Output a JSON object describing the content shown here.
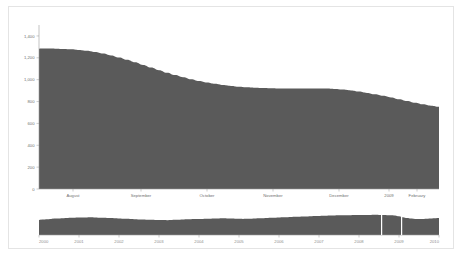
{
  "card": {
    "border_color": "#e4e4e4",
    "background": "#ffffff"
  },
  "chart_data": {
    "type": "area",
    "title": "",
    "subtitle": "",
    "xlabel": "",
    "ylabel": "",
    "grid": false,
    "legend": false,
    "series_color": "#5a5a5a",
    "ylim": [
      0,
      1500
    ],
    "y_ticks": [
      "0",
      "200",
      "400",
      "600",
      "800",
      "1,000",
      "1,200",
      "1,400"
    ],
    "y_tick_values": [
      0,
      200,
      400,
      600,
      800,
      1000,
      1200,
      1400
    ],
    "x_tick_labels": [
      "August",
      "September",
      "October",
      "November",
      "December",
      "2009",
      "February"
    ],
    "x_tick_positions": [
      0.085,
      0.255,
      0.42,
      0.585,
      0.75,
      0.875,
      0.945
    ],
    "x": [
      0.0,
      0.02,
      0.04,
      0.06,
      0.08,
      0.1,
      0.12,
      0.14,
      0.16,
      0.18,
      0.2,
      0.22,
      0.24,
      0.26,
      0.28,
      0.3,
      0.32,
      0.34,
      0.36,
      0.38,
      0.4,
      0.42,
      0.44,
      0.46,
      0.48,
      0.5,
      0.52,
      0.54,
      0.56,
      0.58,
      0.6,
      0.62,
      0.64,
      0.66,
      0.68,
      0.7,
      0.72,
      0.74,
      0.76,
      0.78,
      0.8,
      0.82,
      0.84,
      0.86,
      0.88,
      0.9,
      0.92,
      0.94,
      0.96,
      0.98,
      1.0
    ],
    "values": [
      1283,
      1284,
      1283,
      1281,
      1278,
      1272,
      1264,
      1253,
      1239,
      1222,
      1203,
      1182,
      1159,
      1135,
      1111,
      1087,
      1064,
      1042,
      1022,
      1004,
      988,
      974,
      962,
      951,
      943,
      936,
      931,
      927,
      924,
      922,
      920,
      919,
      919,
      919,
      920,
      920,
      919,
      915,
      909,
      901,
      891,
      879,
      866,
      852,
      838,
      822,
      806,
      790,
      775,
      762,
      752
    ],
    "series_name": ""
  },
  "navigator": {
    "type": "area",
    "color": "#5a5a5a",
    "year_labels": [
      "2000",
      "2001",
      "2002",
      "2003",
      "2004",
      "2005",
      "2006",
      "2007",
      "2008",
      "2009",
      "2010"
    ],
    "year_positions": [
      0.0,
      0.1,
      0.2,
      0.3,
      0.4,
      0.5,
      0.6,
      0.7,
      0.8,
      0.9,
      1.0
    ],
    "selection": {
      "start": 0.855,
      "end": 0.905,
      "handle_color": "#ffffff"
    },
    "values": [
      560,
      575,
      590,
      600,
      612,
      618,
      626,
      634,
      640,
      645,
      650,
      648,
      655,
      660,
      652,
      646,
      640,
      636,
      630,
      624,
      618,
      610,
      602,
      596,
      588,
      580,
      576,
      570,
      566,
      562,
      558,
      556,
      554,
      560,
      566,
      572,
      578,
      584,
      588,
      592,
      596,
      600,
      604,
      608,
      612,
      616,
      620,
      616,
      612,
      608,
      604,
      600,
      604,
      610,
      616,
      622,
      628,
      634,
      640,
      646,
      652,
      658,
      664,
      670,
      676,
      682,
      688,
      694,
      700,
      706,
      712,
      718,
      722,
      726,
      730,
      734,
      736,
      738,
      740,
      742,
      744,
      746,
      748,
      750,
      752,
      748,
      744,
      740,
      736,
      730,
      700,
      660,
      630,
      612,
      600,
      596,
      600,
      608,
      616,
      624,
      630
    ]
  }
}
